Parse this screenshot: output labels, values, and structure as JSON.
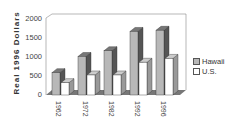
{
  "chart_data": {
    "type": "bar",
    "title": "",
    "xlabel": "",
    "ylabel": "Real 1996 Dollars",
    "categories": [
      "1962",
      "1972",
      "1982",
      "1992",
      "1996"
    ],
    "series": [
      {
        "name": "Hawaii",
        "values": [
          580,
          1000,
          1150,
          1650,
          1680
        ],
        "color": "#b8b8b8"
      },
      {
        "name": "U.S.",
        "values": [
          320,
          520,
          520,
          850,
          950
        ],
        "color": "#ffffff"
      }
    ],
    "ylim": [
      0,
      2000
    ],
    "yticks": [
      0,
      500,
      1000,
      1500,
      2000
    ],
    "grid": false,
    "legend_position": "right",
    "style": "3d-clustered-bar"
  },
  "axis": {
    "ylabel": "Real   1996   Dollars",
    "yticks": [
      "2000",
      "1500",
      "1000",
      "500",
      "0"
    ],
    "xticks": [
      "1962",
      "1972",
      "1982",
      "1992",
      "1996"
    ]
  },
  "legend": {
    "items": [
      {
        "label": "Hawaii",
        "color": "#b8b8b8"
      },
      {
        "label": "U.S.",
        "color": "#ffffff"
      }
    ]
  }
}
